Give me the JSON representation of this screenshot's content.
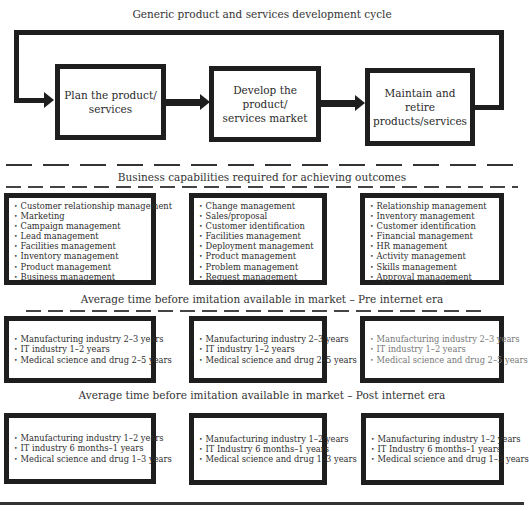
{
  "cycle": {
    "title": "Generic product and services development cycle",
    "stages": [
      {
        "line1": "Plan the product/",
        "line2": "services"
      },
      {
        "line1": "Develop the product/",
        "line2": "services market"
      },
      {
        "line1": "Maintain and retire",
        "line2": "products/services"
      }
    ]
  },
  "capabilities": {
    "title": "Business capabilities required for achieving outcomes",
    "columns": [
      {
        "items": [
          "Customer relationship management",
          "Marketing",
          "Campaign management",
          "Lead management",
          "Facilities management",
          "Inventory management",
          "Product management",
          "Business management"
        ]
      },
      {
        "items": [
          "Change management",
          "Sales/proposal",
          "Customer identification",
          "Facilities management",
          "Deployment management",
          "Product management",
          "Problem management",
          "Request management"
        ]
      },
      {
        "items": [
          "Relationship management",
          "Inventory management",
          "Customer identification",
          "Financial management",
          "HR management",
          "Activity management",
          "Skills management",
          "Approval management"
        ]
      }
    ]
  },
  "pre_internet": {
    "title": "Average time before imitation available in market – Pre internet era",
    "columns": [
      {
        "items": [
          "Manufacturing industry 2–3 years",
          "IT industry 1–2 years",
          "Medical science and drug 2–5 years"
        ]
      },
      {
        "items": [
          "Manufacturing industry 2–3 years",
          "IT industry 1–2 years",
          "Medical science and drug 2–5 years"
        ]
      },
      {
        "items": [
          "Manufacturing industry 2–3 years",
          "IT industry 1–2 years",
          "Medical science and drug 2–5 years"
        ]
      }
    ]
  },
  "post_internet": {
    "title": "Average time before imitation available in market – Post internet era",
    "columns": [
      {
        "items": [
          "Manufacturing industry 1–2 years",
          "IT industry 6 months–1 years",
          "Medical science and drug 1–3 years"
        ]
      },
      {
        "items": [
          "Manufacturing industry 1–2 years",
          "IT Industry 6 months–1 years",
          "Medical science and drug 1–3 years"
        ]
      },
      {
        "items": [
          "Manufacturing industry 1–2 years",
          "IT Industry 6 months–1 years",
          "Medical science and drug 1–3 years"
        ]
      }
    ]
  }
}
